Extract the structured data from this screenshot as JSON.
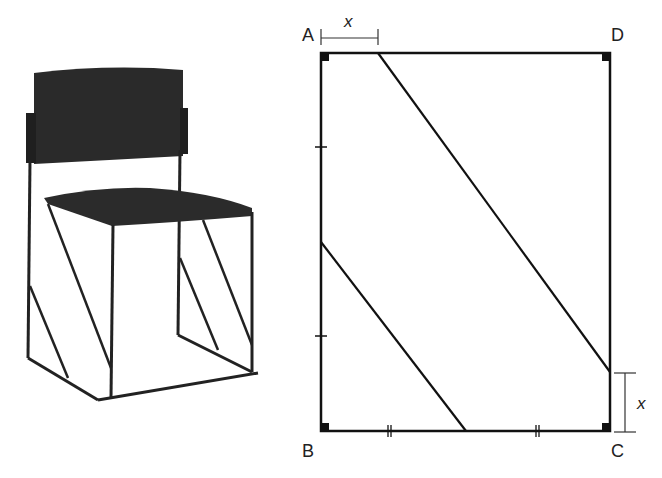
{
  "figure": {
    "photo": {
      "subject": "stacking chair with diagonal leg braces",
      "icon": "chair-photo"
    },
    "diagram": {
      "vertices": [
        {
          "id": "A",
          "label": "A",
          "x": 321,
          "y": 53
        },
        {
          "id": "B",
          "label": "B",
          "x": 321,
          "y": 431
        },
        {
          "id": "C",
          "label": "C",
          "x": 610,
          "y": 431
        },
        {
          "id": "D",
          "label": "D",
          "x": 610,
          "y": 53
        }
      ],
      "dimension_labels": {
        "top": "x",
        "right": "x"
      },
      "segments": [
        {
          "name": "upper-diagonal",
          "from": [
            378,
            53
          ],
          "to": [
            610,
            372
          ]
        },
        {
          "name": "lower-diagonal",
          "from": [
            321,
            242
          ],
          "to": [
            466,
            431
          ]
        }
      ],
      "right_angle_marks": [
        "A",
        "B",
        "C",
        "D"
      ],
      "tick_marks": {
        "left_side": "single ticks at AB trisection-style marks",
        "bottom_side": "double ticks marking equal segments"
      }
    }
  }
}
